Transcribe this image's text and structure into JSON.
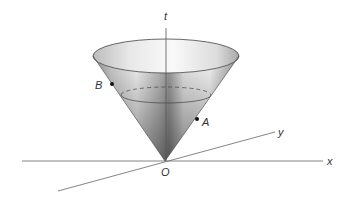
{
  "figure": {
    "labels": {
      "t": "t",
      "x": "x",
      "y": "y",
      "origin": "O",
      "point_a": "A",
      "point_b": "B"
    },
    "colors": {
      "axis": "#555555",
      "cone_dark": "#6a6a6a",
      "cone_light": "#f2f2f2",
      "outline": "#444444",
      "point": "#111111"
    }
  }
}
